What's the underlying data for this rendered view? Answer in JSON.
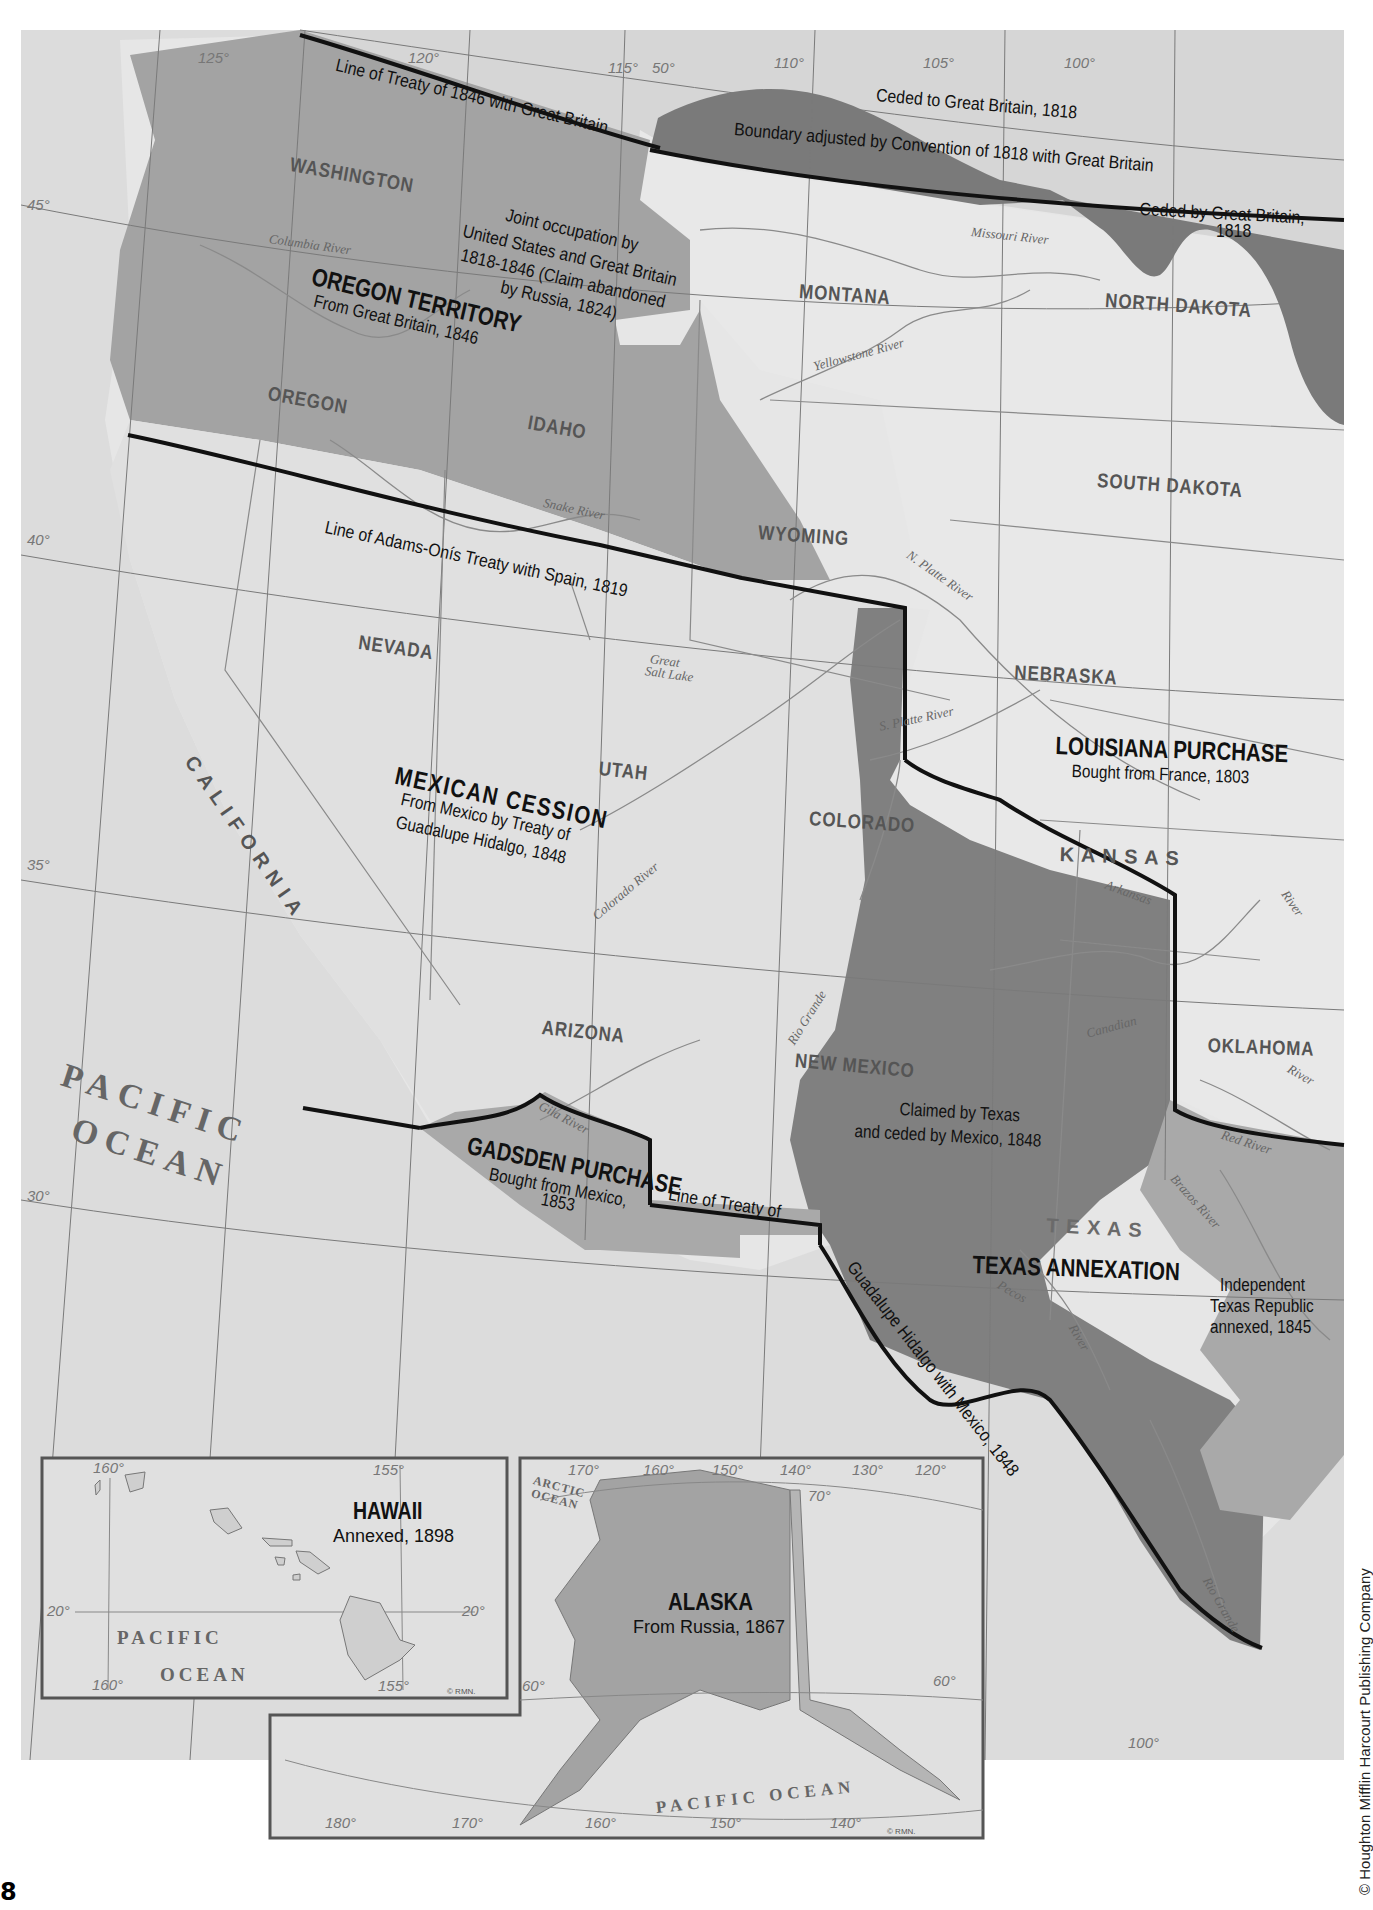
{
  "page": {
    "page_number": "8",
    "copyright": "© Houghton Mifflin Harcourt Publishing Company"
  },
  "colors": {
    "background": "#ffffff",
    "map_land_foreign": "#d9d9d9",
    "map_land_us": "#e3e3e3",
    "louisiana_purchase": "#e4e4e4",
    "oregon_territory": "#a3a3a3",
    "mexican_cession": "#e0e0e0",
    "texas_claimed": "#7f7f7f",
    "texas_republic": "#a8a8a8",
    "gadsden_purchase": "#a9a9a9",
    "ceded_1818": "#7a7a7a",
    "boundary_line": "#111111",
    "river_line": "#8a8a8a",
    "grid_line": "#777777"
  },
  "regions": {
    "oregon": {
      "title": "OREGON TERRITORY",
      "subtitle": "From Great Britain, 1846"
    },
    "louisiana": {
      "title": "LOUISIANA PURCHASE",
      "subtitle": "Bought from France, 1803"
    },
    "mexican_cession": {
      "title": "MEXICAN CESSION",
      "subtitle_1": "From Mexico by Treaty of",
      "subtitle_2": "Guadalupe Hidalgo, 1848"
    },
    "gadsden": {
      "title": "GADSDEN PURCHASE",
      "subtitle_1": "Bought from Mexico,",
      "subtitle_2": "1853"
    },
    "texas": {
      "title": "TEXAS ANNEXATION",
      "subtitle_1": "Independent",
      "subtitle_2": "Texas Republic",
      "subtitle_3": "annexed, 1845"
    },
    "texas_claim": {
      "line_1": "Claimed by Texas",
      "line_2": "and ceded by Mexico, 1848"
    },
    "joint_occupation": {
      "line_1": "Joint occupation by",
      "line_2": "United States and Great Britain",
      "line_3": "1818-1846 (Claim abandoned",
      "line_4": "by Russia, 1824)"
    },
    "ceded_to_gb": "Ceded to Great Britain, 1818",
    "ceded_by_gb": {
      "line_1": "Ceded by Great Britain,",
      "line_2": "1818"
    }
  },
  "boundary_labels": {
    "treaty_1846": "Line of Treaty of 1846 with Great Britain",
    "convention_1818": "Boundary adjusted by Convention of 1818 with Great Britain",
    "adams_onis": "Line of Adams-Onís Treaty with Spain, 1819",
    "guadalupe_1": "Line of Treaty of",
    "guadalupe_2": "Guadalupe Hidalgo with Mexico, 1848"
  },
  "states": {
    "washington": "WASHINGTON",
    "oregon": "OREGON",
    "idaho": "IDAHO",
    "montana": "MONTANA",
    "north_dakota": "NORTH DAKOTA",
    "south_dakota": "SOUTH DAKOTA",
    "wyoming": "WYOMING",
    "nebraska": "NEBRASKA",
    "nevada": "NEVADA",
    "utah": "UTAH",
    "colorado": "COLORADO",
    "kansas": "K A N S A S",
    "california": "C A L I F O R N I A",
    "arizona": "ARIZONA",
    "new_mexico": "NEW MEXICO",
    "oklahoma": "OKLAHOMA",
    "texas": "T E X A S"
  },
  "rivers": {
    "columbia": "Columbia River",
    "snake": "Snake River",
    "missouri": "Missouri River",
    "yellowstone": "Yellowstone River",
    "n_platte": "N. Platte River",
    "s_platte": "S. Platte River",
    "great_salt_lake_1": "Great",
    "great_salt_lake_2": "Salt Lake",
    "colorado": "Colorado River",
    "gila": "Gila River",
    "rio_grande": "Rio Grande",
    "arkansas": "Arkansas",
    "arkansas_river": "River",
    "canadian": "Canadian",
    "canadian_river": "River",
    "red": "Red River",
    "brazos": "Brazos River",
    "pecos": "Pecos",
    "pecos_river": "River",
    "rio_grande_lower": "Rio Grande"
  },
  "ocean": {
    "pacific_1": "PACIFIC",
    "pacific_2": "OCEAN"
  },
  "graticule": {
    "lon_125": "125°",
    "lon_120": "120°",
    "lon_115": "115°",
    "lat_50": "50°",
    "lon_110": "110°",
    "lon_105": "105°",
    "lon_100": "100°",
    "lat_45": "45°",
    "lat_40": "40°",
    "lat_35": "35°",
    "lat_30": "30°",
    "lon_100_bottom": "100°"
  },
  "insets": {
    "hawaii": {
      "title": "HAWAII",
      "subtitle": "Annexed, 1898",
      "ocean_1": "PACIFIC",
      "ocean_2": "OCEAN",
      "ticks": {
        "lon_160_top": "160°",
        "lon_155_top": "155°",
        "lat_20_left": "20°",
        "lat_20_right": "20°",
        "lon_160_bottom": "160°",
        "lon_155_bottom": "155°"
      },
      "credit": "© RMN."
    },
    "alaska": {
      "title": "ALASKA",
      "subtitle": "From Russia, 1867",
      "arctic_1": "ARCTIC",
      "arctic_2": "OCEAN",
      "pacific": "PACIFIC OCEAN",
      "ticks": {
        "lon_170": "170°",
        "lon_160": "160°",
        "lon_150": "150°",
        "lon_140": "140°",
        "lon_130": "130°",
        "lon_120": "120°",
        "lat_70": "70°",
        "lat_60": "60°",
        "lat_60_right": "60°",
        "lon_180_bottom": "180°",
        "lon_170_bottom": "170°",
        "lon_160_bottom": "160°",
        "lon_150_bottom": "150°",
        "lon_140_bottom": "140°"
      },
      "credit": "© RMN."
    }
  }
}
